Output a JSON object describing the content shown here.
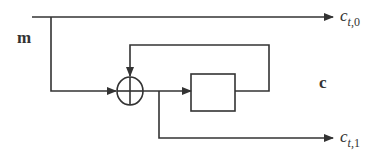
{
  "diagram": {
    "type": "block-diagram",
    "labels": {
      "input": "m",
      "state": "c",
      "output0_base": "c",
      "output0_sub_var": "t",
      "output0_sub_idx": ",0",
      "output1_base": "c",
      "output1_sub_var": "t",
      "output1_sub_idx": ",1"
    },
    "nodes": [
      {
        "id": "xor",
        "kind": "xor-adder"
      },
      {
        "id": "delay",
        "kind": "register-box"
      }
    ],
    "edges": [
      {
        "from": "m",
        "to": "c_t0"
      },
      {
        "from": "m",
        "to": "xor"
      },
      {
        "from": "xor",
        "to": "delay"
      },
      {
        "from": "delay",
        "to": "xor",
        "kind": "feedback"
      },
      {
        "from": "xor",
        "to": "c_t1"
      }
    ],
    "line_color": "#333333"
  }
}
